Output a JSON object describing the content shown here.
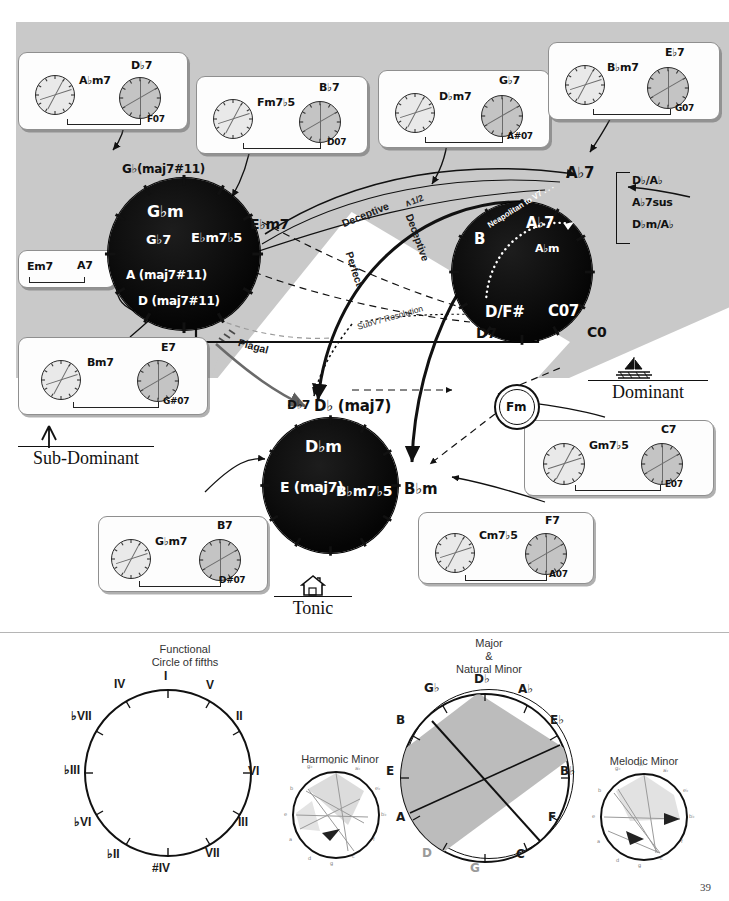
{
  "page": {
    "number": "39"
  },
  "functions": {
    "subdominant": {
      "label": "Sub-Dominant",
      "icon": "arrow-up-icon"
    },
    "dominant": {
      "label": "Dominant",
      "icon": "sailboat-icon"
    },
    "tonic": {
      "label": "Tonic",
      "icon": "home-icon"
    }
  },
  "circles": {
    "subdominant": {
      "name": "subdominant-circle",
      "outer_label": "G♭(maj7#11)",
      "inner_labels": [
        "G♭m",
        "G♭7",
        "E♭m7♭5",
        "A (maj7#11)",
        "D (maj7#11)"
      ],
      "side_label": "E♭m7"
    },
    "dominant": {
      "name": "dominant-circle",
      "outer_label": "A♭7",
      "inner_labels": [
        "B",
        "A♭7",
        "A♭m",
        "D/F#",
        "C07"
      ],
      "side_labels": [
        "D7",
        "C0"
      ],
      "dotted_label": "Neapolitan to V7 . . .",
      "bracket_alternatives": [
        "D♭/A♭",
        "A♭7sus",
        "D♭m/A♭"
      ]
    },
    "tonic": {
      "name": "tonic-circle",
      "outer_label": "D♭ (maj7)",
      "inner_labels": [
        "D♭m",
        "E (maj7)",
        "B♭m7♭5"
      ],
      "side_labels": [
        "D♭7",
        "B♭m"
      ]
    },
    "relative": {
      "label": "Fm",
      "name": "relative-minor-circle"
    }
  },
  "cadences": [
    {
      "label": "Deceptive",
      "variant": "upper"
    },
    {
      "label": "Deceptive",
      "variant": "lower"
    },
    {
      "label": "Perfect",
      "variant": "main"
    },
    {
      "label": "Plagal",
      "variant": "main"
    },
    {
      "label": "SubV7 Resolution",
      "variant": "dotted"
    },
    {
      "label": "∧1/2",
      "variant": "annotation"
    }
  ],
  "chord_boxes": [
    {
      "id": "box-abm7-db7",
      "left_chord": "A♭m7",
      "right_chord": "D♭7",
      "right_alt": "F07",
      "left_pie": "hollow",
      "right_pie": "filled"
    },
    {
      "id": "box-fm7b5-bb7",
      "left_chord": "Fm7♭5",
      "right_chord": "B♭7",
      "right_alt": "D07",
      "left_pie": "hollow",
      "right_pie": "filled"
    },
    {
      "id": "box-dbm7-gb7",
      "left_chord": "D♭m7",
      "right_chord": "G♭7",
      "right_alt": "A#07",
      "left_pie": "hollow",
      "right_pie": "filled"
    },
    {
      "id": "box-bbm7-eb7",
      "left_chord": "B♭m7",
      "right_chord": "E♭7",
      "right_alt": "G07",
      "left_pie": "hollow",
      "right_pie": "filled"
    },
    {
      "id": "box-em7-a7",
      "left_chord": "Em7",
      "right_chord": "A7",
      "right_alt": "",
      "left_pie": "none",
      "right_pie": "none"
    },
    {
      "id": "box-bm7-e7",
      "left_chord": "Bm7",
      "right_chord": "E7",
      "right_alt": "G#07",
      "left_pie": "hollow",
      "right_pie": "filled"
    },
    {
      "id": "box-gbm7-b7",
      "left_chord": "G♭m7",
      "right_chord": "B7",
      "right_alt": "D#07",
      "left_pie": "hollow",
      "right_pie": "filled"
    },
    {
      "id": "box-cm7b5-f7",
      "left_chord": "Cm7♭5",
      "right_chord": "F7",
      "right_alt": "A07",
      "left_pie": "hollow",
      "right_pie": "filled"
    },
    {
      "id": "box-gm7b5-c7",
      "left_chord": "Gm7♭5",
      "right_chord": "C7",
      "right_alt": "E07",
      "left_pie": "hollow",
      "right_pie": "filled"
    }
  ],
  "chart_data": [
    {
      "type": "pie",
      "name": "functional-circle-of-fifths",
      "title": "Functional\nCircle of fifths",
      "categories": [
        "I",
        "V",
        "II",
        "VI",
        "III",
        "VII",
        "#IV",
        "♭II",
        "♭VI",
        "♭III",
        "♭VII",
        "IV"
      ],
      "values": [
        1,
        1,
        1,
        1,
        1,
        1,
        1,
        1,
        1,
        1,
        1,
        1
      ],
      "legend": "none",
      "grid": false
    },
    {
      "type": "pie",
      "name": "major-natural-minor-circle",
      "title": "Major\n&\nNatural Minor",
      "categories": [
        "D♭",
        "A♭",
        "E♭",
        "B♭",
        "F",
        "C",
        "G",
        "D",
        "A",
        "E",
        "B",
        "G♭"
      ],
      "values": [
        1,
        1,
        1,
        1,
        1,
        1,
        1,
        1,
        1,
        1,
        1,
        1
      ],
      "shaded_sector": [
        "G♭",
        "D♭",
        "A♭",
        "E♭"
      ],
      "legend": "none",
      "grid": false
    },
    {
      "type": "pie",
      "name": "harmonic-minor-circle",
      "title": "Harmonic Minor",
      "categories": [
        "g♭",
        "d♭",
        "a♭",
        "e♭",
        "b♭",
        "f",
        "c",
        "g",
        "d",
        "a",
        "e",
        "b"
      ],
      "values": [
        1,
        1,
        1,
        1,
        1,
        1,
        1,
        1,
        1,
        1,
        1,
        1
      ],
      "legend": "none",
      "grid": false
    },
    {
      "type": "pie",
      "name": "melodic-minor-circle",
      "title": "Melodic Minor",
      "categories": [
        "g♭",
        "d♭",
        "a♭",
        "e♭",
        "b♭",
        "f",
        "c",
        "g",
        "d",
        "a",
        "e",
        "b"
      ],
      "values": [
        1,
        1,
        1,
        1,
        1,
        1,
        1,
        1,
        1,
        1,
        1,
        1
      ],
      "legend": "none",
      "grid": false
    }
  ],
  "cof_roman": [
    "I",
    "V",
    "II",
    "VI",
    "III",
    "VII",
    "#IV",
    "♭II",
    "♭VI",
    "♭III",
    "♭VII",
    "IV"
  ],
  "cof_major": [
    "D♭",
    "A♭",
    "E♭",
    "B♭",
    "F",
    "C",
    "G",
    "D",
    "A",
    "E",
    "B",
    "G♭"
  ],
  "cof_titles": {
    "functional": "Functional\nCircle of fifths",
    "major_minor": "Major\n&\nNatural Minor",
    "harmonic": "Harmonic Minor",
    "melodic": "Melodic Minor"
  },
  "colors": {
    "gray_field": "#c9c9c9",
    "circle_fill": "#0a0a0a",
    "pie_filled": "#c4c4c4",
    "pie_hollow": "#e9e9e9",
    "shade": "#bcbcbc"
  }
}
